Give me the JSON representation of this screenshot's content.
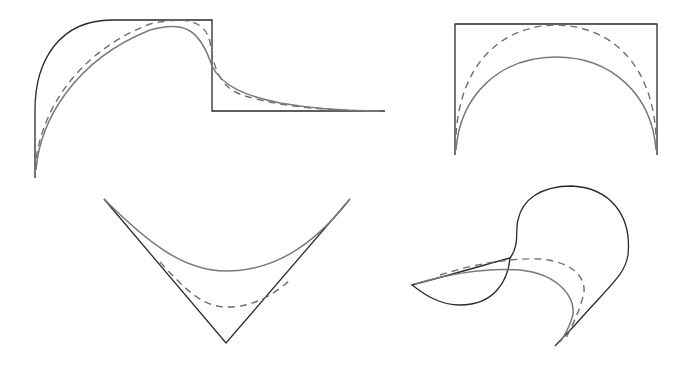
{
  "figure": {
    "type": "curve-approximation-diagram",
    "panels": [
      {
        "id": "step",
        "description": "step-shaped target outline with smooth and dashed approximations",
        "curves": [
          "outline",
          "dashed",
          "smooth"
        ]
      },
      {
        "id": "box",
        "description": "rectangular target outline with dashed and smooth arch approximations",
        "curves": [
          "outline",
          "dashed",
          "smooth"
        ]
      },
      {
        "id": "vee",
        "description": "V-shaped target outline with dashed and smooth approximations",
        "curves": [
          "outline",
          "dashed",
          "smooth"
        ]
      },
      {
        "id": "loop",
        "description": "self-intersecting loop target outline with dashed and smooth approximations",
        "curves": [
          "outline",
          "dashed",
          "smooth"
        ]
      }
    ],
    "styles": {
      "outline_color": "#2a2a2a",
      "smooth_color": "#7a7a7a",
      "dashed_color": "#6f6f6f"
    }
  }
}
